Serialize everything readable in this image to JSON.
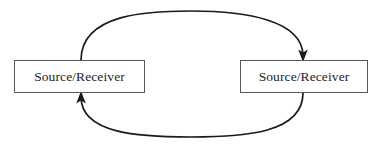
{
  "diagram": {
    "type": "cyclic-flow",
    "background_color": "#ffffff",
    "stroke_color": "#1a1a1c",
    "box_border_color": "#59595c",
    "text_color": "#1d1d1f",
    "nodes": [
      {
        "id": "left",
        "label": "Source/Receiver",
        "x": 14,
        "y": 60,
        "width": 131,
        "height": 33
      },
      {
        "id": "right",
        "label": "Source/Receiver",
        "x": 240,
        "y": 60,
        "width": 128,
        "height": 33
      }
    ],
    "connectors": [
      {
        "id": "top-arc",
        "from": "left",
        "to": "right",
        "direction": "left-to-right",
        "arrowhead": "at-target",
        "arrowhead_orientation": "down",
        "path": "M 81 60 C 81 13 150 11 191 11 C 245 11 303 20 303 57",
        "apex_y": 12
      },
      {
        "id": "bottom-arc",
        "from": "right",
        "to": "left",
        "direction": "right-to-left",
        "arrowhead": "at-target",
        "arrowhead_orientation": "up",
        "path": "M 303 93 C 303 133 245 137 191 137 C 140 137 81 134 81 96",
        "apex_y": 137
      }
    ]
  }
}
